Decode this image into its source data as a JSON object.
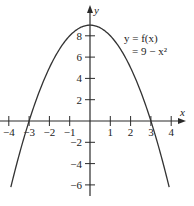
{
  "chart_data": {
    "type": "line",
    "title": "",
    "annotation_line1": "y = f(x)",
    "annotation_line2": "= 9 − x²",
    "function": "y = 9 - x^2",
    "xlabel": "x",
    "ylabel": "y",
    "xlim": [
      -4.2,
      4.4
    ],
    "ylim": [
      -7,
      9.3
    ],
    "x_ticks": [
      -4,
      -3,
      -2,
      -1,
      1,
      2,
      3,
      4
    ],
    "x_tick_labels": [
      "−4",
      "−3",
      "−2",
      "−1",
      "1",
      "2",
      "3",
      "4"
    ],
    "y_ticks": [
      8,
      6,
      4,
      2,
      -2,
      -4,
      -6
    ],
    "y_tick_labels": [
      "8",
      "6",
      "4",
      "2",
      "−2",
      "−4",
      "−6"
    ],
    "grid": false,
    "legend": "none",
    "series": [
      {
        "name": "y = 9 − x²",
        "x": [
          -4,
          -3.5,
          -3,
          -2.5,
          -2,
          -1.5,
          -1,
          -0.5,
          0,
          0.5,
          1,
          1.5,
          2,
          2.5,
          3,
          3.5,
          4
        ],
        "y": [
          -7,
          -3.25,
          0,
          2.75,
          5,
          6.75,
          8,
          8.75,
          9,
          8.75,
          8,
          6.75,
          5,
          2.75,
          0,
          -3.25,
          -7
        ]
      }
    ],
    "key_points": {
      "vertex": [
        0,
        9
      ],
      "x_intercepts": [
        -3,
        3
      ]
    }
  }
}
